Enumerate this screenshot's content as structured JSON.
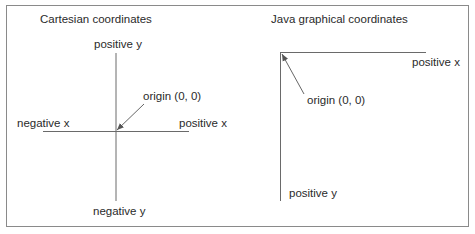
{
  "left_panel": {
    "title": "Cartesian coordinates",
    "positive_y": "positive y",
    "negative_y": "negative y",
    "positive_x": "positive x",
    "negative_x": "negative x",
    "origin": "origin (0, 0)"
  },
  "right_panel": {
    "title": "Java graphical coordinates",
    "positive_x": "positive x",
    "positive_y": "positive y",
    "origin": "origin (0, 0)"
  },
  "colors": {
    "line": "#6a6a6a",
    "border": "#8a8a8a",
    "text": "#2a2a2a"
  }
}
